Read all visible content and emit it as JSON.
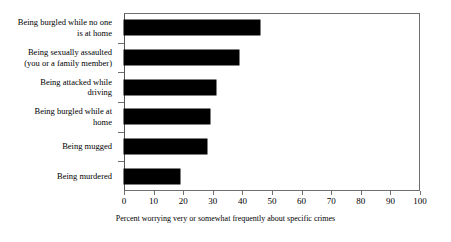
{
  "chart_data": {
    "type": "bar",
    "orientation": "horizontal",
    "title": "",
    "xlabel": "Percent worrying very or somewhat frequently about specific crimes",
    "ylabel": "",
    "xlim": [
      0,
      100
    ],
    "xticks": [
      0,
      10,
      20,
      30,
      40,
      50,
      60,
      70,
      80,
      90,
      100
    ],
    "grid": false,
    "legend": null,
    "bar_color": "#000000",
    "categories": [
      "Being burgled while no one is at home",
      "Being sexually assaulted (you or a family member)",
      "Being attacked while driving",
      "Being burgled while at home",
      "Being mugged",
      "Being murdered"
    ],
    "category_lines": [
      [
        "Being burgled while no one",
        "is at home"
      ],
      [
        "Being sexually assaulted",
        "(you or a family member)"
      ],
      [
        "Being attacked while",
        "driving"
      ],
      [
        "Being burgled while at",
        "home"
      ],
      [
        "Being mugged"
      ],
      [
        "Being murdered"
      ]
    ],
    "values": [
      46,
      39,
      31,
      29,
      28,
      19
    ]
  }
}
